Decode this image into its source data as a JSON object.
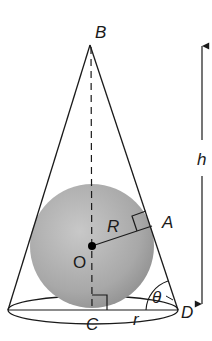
{
  "diagram": {
    "labels": {
      "apex": "B",
      "tangent_point": "A",
      "center": "O",
      "base_center": "C",
      "base_edge": "D",
      "sphere_radius": "R",
      "cone_radius": "r",
      "angle": "θ",
      "height": "h"
    },
    "colors": {
      "stroke": "#1a1a1a",
      "sphere_light": "#c4c4c4",
      "sphere_dark": "#8f8f8f"
    }
  }
}
